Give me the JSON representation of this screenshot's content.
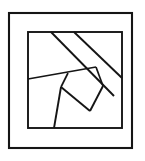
{
  "figure": {
    "name": "patchwork-quilt-block",
    "title": "",
    "caption": "",
    "canvas": {
      "width": 145,
      "height": 161
    },
    "colors": {
      "background": "#ffffff",
      "line": "#151515",
      "fill": "#ffffff"
    },
    "outer_border": {
      "label": "outer border frame",
      "x": 9,
      "y": 13,
      "width": 123,
      "height": 135,
      "stroke_width": 2.1
    },
    "inner_frame": {
      "label": "inner frame rectangle",
      "x": 28,
      "y": 32,
      "width": 94,
      "height": 96,
      "stroke_width": 1.9
    },
    "seams": [
      {
        "name": "upper-diagonal-band-top",
        "points": "51,32 114,96"
      },
      {
        "name": "upper-diagonal-band-bottom",
        "points": "74,32 122,78"
      },
      {
        "name": "left-sash-seam",
        "points": "28,79 96,67"
      },
      {
        "name": "quad-left-edge",
        "points": "68,73 61,87"
      },
      {
        "name": "quad-bottom-left-edge",
        "points": "61,87 54,128"
      },
      {
        "name": "quad-bottom-edge",
        "points": "61,87 90,111"
      },
      {
        "name": "quad-right-edge",
        "points": "90,111 103,86"
      },
      {
        "name": "quad-top-right-seam",
        "points": "103,86 96,67"
      }
    ],
    "pieces": [
      {
        "name": "piece-top-sash"
      },
      {
        "name": "piece-left-sash"
      },
      {
        "name": "piece-right-sash"
      },
      {
        "name": "piece-bottom-sash"
      },
      {
        "name": "piece-upper-triangle"
      },
      {
        "name": "piece-diagonal-band"
      },
      {
        "name": "piece-right-wedge"
      },
      {
        "name": "piece-left-wedge"
      },
      {
        "name": "piece-center-quad"
      },
      {
        "name": "piece-lower-wedge"
      },
      {
        "name": "piece-bottom-wedge"
      }
    ]
  }
}
